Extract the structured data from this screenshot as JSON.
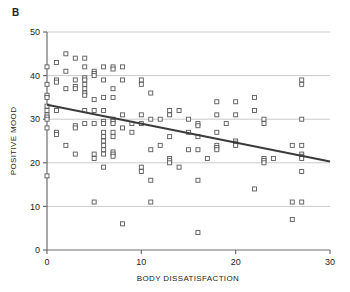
{
  "figure": {
    "panel_label": "B",
    "background_color": "#ffffff"
  },
  "chart_data": {
    "type": "scatter",
    "title": "",
    "panel": "B",
    "xlabel": "BODY DISSATISFACTION",
    "ylabel": "POSITIVE MOOD",
    "xlim": [
      0,
      30
    ],
    "ylim": [
      0,
      50
    ],
    "xticks": [
      0,
      10,
      20,
      30
    ],
    "yticks": [
      0,
      10,
      20,
      30,
      40,
      50
    ],
    "xtick_labels": [
      "0",
      "10",
      "20",
      "30"
    ],
    "ytick_labels": [
      "0",
      "10",
      "20",
      "30",
      "40",
      "50"
    ],
    "grid": "horizontal",
    "grid_color": "#bcbcbc",
    "axis_color": "#6d6e71",
    "legend": "none",
    "marker": {
      "shape": "open-square",
      "size": 4,
      "edge_color": "#58595b",
      "fill_color": "#ffffff"
    },
    "trendline": {
      "type": "linear-fit",
      "color": "#3b3b3b",
      "width": 2,
      "x_start": 0,
      "y_start": 33.3,
      "x_end": 30,
      "y_end": 20.3,
      "slope": -0.4333,
      "intercept": 33.3
    },
    "points": [
      [
        0,
        42
      ],
      [
        0,
        38
      ],
      [
        0,
        35.5
      ],
      [
        0,
        35
      ],
      [
        0,
        33
      ],
      [
        0,
        32
      ],
      [
        0,
        31
      ],
      [
        0,
        30.5
      ],
      [
        0,
        30
      ],
      [
        0,
        28
      ],
      [
        0,
        17
      ],
      [
        1,
        43
      ],
      [
        1,
        39
      ],
      [
        1,
        38.5
      ],
      [
        1,
        32
      ],
      [
        1,
        27
      ],
      [
        1,
        26.5
      ],
      [
        2,
        45
      ],
      [
        2,
        41
      ],
      [
        2,
        37
      ],
      [
        2,
        24
      ],
      [
        3,
        44
      ],
      [
        3,
        39
      ],
      [
        3,
        37.5
      ],
      [
        3,
        37
      ],
      [
        3,
        28.5
      ],
      [
        3,
        28
      ],
      [
        3,
        22
      ],
      [
        4,
        44
      ],
      [
        4,
        42
      ],
      [
        4,
        39.5
      ],
      [
        4,
        39
      ],
      [
        4,
        38
      ],
      [
        4,
        37
      ],
      [
        4,
        36
      ],
      [
        4,
        35.5
      ],
      [
        4,
        32
      ],
      [
        4,
        29
      ],
      [
        5,
        41
      ],
      [
        5,
        40.5
      ],
      [
        5,
        40
      ],
      [
        5,
        34.5
      ],
      [
        5,
        32
      ],
      [
        5,
        29
      ],
      [
        5,
        22
      ],
      [
        5,
        21
      ],
      [
        5,
        11
      ],
      [
        6,
        42
      ],
      [
        6,
        39
      ],
      [
        6,
        35
      ],
      [
        6,
        32
      ],
      [
        6,
        29.5
      ],
      [
        6,
        29
      ],
      [
        6,
        27
      ],
      [
        6,
        26
      ],
      [
        6,
        25
      ],
      [
        6,
        24
      ],
      [
        6,
        23
      ],
      [
        6,
        22
      ],
      [
        6,
        19
      ],
      [
        7,
        42
      ],
      [
        7,
        41.5
      ],
      [
        7,
        37
      ],
      [
        7,
        35
      ],
      [
        7,
        30
      ],
      [
        7,
        29.5
      ],
      [
        7,
        29
      ],
      [
        7,
        27
      ],
      [
        7,
        26
      ],
      [
        7,
        22.5
      ],
      [
        7,
        22
      ],
      [
        7,
        21.5
      ],
      [
        8,
        42
      ],
      [
        8,
        39
      ],
      [
        8,
        31
      ],
      [
        8,
        28
      ],
      [
        8,
        6
      ],
      [
        9,
        29
      ],
      [
        9,
        27
      ],
      [
        10,
        39
      ],
      [
        10,
        38
      ],
      [
        10,
        31
      ],
      [
        10,
        29
      ],
      [
        10,
        19
      ],
      [
        10,
        18
      ],
      [
        11,
        36
      ],
      [
        11,
        30
      ],
      [
        11,
        23
      ],
      [
        11,
        16
      ],
      [
        11,
        11
      ],
      [
        12,
        30
      ],
      [
        12,
        24
      ],
      [
        13,
        32
      ],
      [
        13,
        31
      ],
      [
        13,
        26
      ],
      [
        13,
        21
      ],
      [
        13,
        20.5
      ],
      [
        13,
        20
      ],
      [
        14,
        32
      ],
      [
        14,
        19
      ],
      [
        15,
        30
      ],
      [
        15,
        27
      ],
      [
        15,
        23
      ],
      [
        16,
        29
      ],
      [
        16,
        28.5
      ],
      [
        16,
        26
      ],
      [
        16,
        23
      ],
      [
        16,
        16
      ],
      [
        16,
        4
      ],
      [
        17,
        21
      ],
      [
        18,
        34
      ],
      [
        18,
        31
      ],
      [
        18,
        27
      ],
      [
        18,
        24
      ],
      [
        18,
        23.5
      ],
      [
        18,
        23
      ],
      [
        19,
        29
      ],
      [
        20,
        34
      ],
      [
        20,
        31
      ],
      [
        20,
        25
      ],
      [
        20,
        24.5
      ],
      [
        20,
        24
      ],
      [
        22,
        35
      ],
      [
        22,
        32
      ],
      [
        22,
        14
      ],
      [
        23,
        30
      ],
      [
        23,
        29
      ],
      [
        23,
        21
      ],
      [
        23,
        20.5
      ],
      [
        23,
        20
      ],
      [
        24,
        21
      ],
      [
        26,
        24
      ],
      [
        26,
        11
      ],
      [
        26,
        7
      ],
      [
        27,
        39
      ],
      [
        27,
        38
      ],
      [
        27,
        30
      ],
      [
        27,
        24
      ],
      [
        27,
        22
      ],
      [
        27,
        21.5
      ],
      [
        27,
        21
      ],
      [
        27,
        18
      ],
      [
        27,
        11
      ]
    ]
  }
}
